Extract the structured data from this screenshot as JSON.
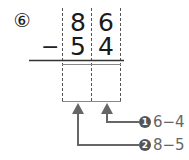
{
  "problem": {
    "number_label": "⑥",
    "minuend": [
      "8",
      "6"
    ],
    "operator": "−",
    "subtrahend": [
      "5",
      "4"
    ],
    "answer_boxes": [
      "",
      ""
    ]
  },
  "hints": [
    {
      "step": "1",
      "text": "6−4"
    },
    {
      "step": "2",
      "text": "8−5"
    }
  ],
  "colors": {
    "text": "#222222",
    "guide_dash": "#555555",
    "arrow": "#666666",
    "hint_text": "#666666"
  }
}
